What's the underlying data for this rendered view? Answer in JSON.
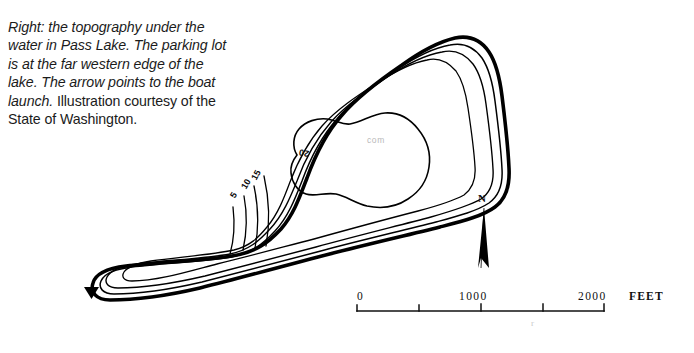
{
  "caption": {
    "italic_part": "Right: the topography under the water in Pass Lake. The parking lot is at the far western edge of the lake. The arrow points to the boat launch.",
    "roman_part": " Illustration courtesy of the State of Washington."
  },
  "map": {
    "title": "Pass Lake bathymetric map",
    "watermark_text": "com",
    "artifact_text": "r",
    "depth_labels": [
      {
        "id": "depth-5",
        "value": "5"
      },
      {
        "id": "depth-10",
        "value": "10"
      },
      {
        "id": "depth-15",
        "value": "15"
      },
      {
        "id": "depth-20",
        "value": "20"
      }
    ],
    "boat_launch_marker": "solid-triangle-marker",
    "ink_color": "#000000",
    "background_color": "#ffffff"
  },
  "compass": {
    "label": "N",
    "icon": "north-arrow-icon"
  },
  "scale_bar": {
    "unit_label": "FEET",
    "ticks": [
      {
        "label": "0",
        "value": 0
      },
      {
        "label": "",
        "value": 500
      },
      {
        "label": "1000",
        "value": 1000
      },
      {
        "label": "",
        "value": 1500
      },
      {
        "label": "2000",
        "value": 2000
      }
    ],
    "labels": {
      "zero": "0",
      "mid": "1000",
      "max": "2000",
      "unit": "FEET"
    }
  }
}
